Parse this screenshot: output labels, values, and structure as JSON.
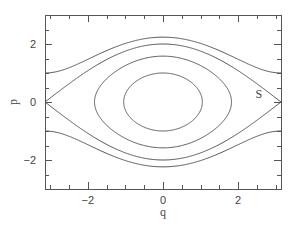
{
  "chart_data": {
    "type": "line",
    "title": "",
    "xlabel": "q",
    "ylabel": "p",
    "xlim": [
      -3.1416,
      3.1416
    ],
    "ylim": [
      -3,
      3
    ],
    "x_major_ticks": [
      -2,
      0,
      2
    ],
    "x_tick_labels": [
      "−2",
      "0",
      "2"
    ],
    "x_minor_step": 0.5,
    "y_major_ticks": [
      -2,
      0,
      2
    ],
    "y_tick_labels": [
      "−2",
      "0",
      "2"
    ],
    "y_minor_step": 0.5,
    "grid": false,
    "legend": null,
    "annotations": [
      {
        "text": "S",
        "q": 2.55,
        "p": 0.28
      }
    ],
    "series": [
      {
        "name": "rotation orbit (H=1.5)",
        "energy": 1.5,
        "kind": "rotation",
        "p_at_q0": 2.236,
        "p_at_qpi": 1.0
      },
      {
        "name": "separatrix (H=1)",
        "energy": 1.0,
        "kind": "separatrix",
        "p_at_q0": 2.0,
        "p_at_qpi": 0.0
      },
      {
        "name": "libration orbit (H=0.25)",
        "energy": 0.25,
        "kind": "libration",
        "p_at_q0": 1.58,
        "q_max": 1.823
      },
      {
        "name": "libration orbit (H=-0.5)",
        "energy": -0.5,
        "kind": "libration",
        "p_at_q0": 1.0,
        "q_max": 1.047
      }
    ]
  },
  "plot_area": {
    "left": 45,
    "top": 15,
    "right": 281,
    "bottom": 189
  },
  "colors": {
    "line": "#555555",
    "text": "#444444",
    "background": "#ffffff"
  }
}
